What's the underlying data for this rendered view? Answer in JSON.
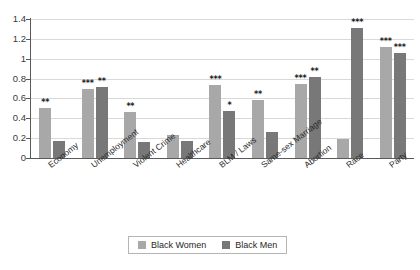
{
  "chart_data": {
    "type": "bar",
    "title": "",
    "subtitle": "",
    "xlabel": "",
    "ylabel": "",
    "ylim": [
      0,
      1.4
    ],
    "yticks": [
      0,
      0.2,
      0.4,
      0.6,
      0.8,
      1,
      1.2,
      1.4
    ],
    "ytick_labels": [
      "0",
      "0.2",
      "0.4",
      "0.6",
      "0.8",
      "1",
      "1.2",
      "1.4"
    ],
    "grid": true,
    "legend_position": "bottom-center",
    "categories": [
      "Economy",
      "Unemployment",
      "Violent Crime",
      "Healthcare",
      "BLM / Laws",
      "Same-sex Marriage",
      "Abortion",
      "Race",
      "Party"
    ],
    "series": [
      {
        "name": "Black Women",
        "color": "#a8a8a8",
        "values": [
          0.5,
          0.7,
          0.46,
          0.23,
          0.74,
          0.58,
          0.75,
          0.19,
          1.12
        ],
        "annotations": [
          "**",
          "***",
          "**",
          "",
          "***",
          "**",
          "***",
          "",
          "***"
        ]
      },
      {
        "name": "Black Men",
        "color": "#787878",
        "values": [
          0.17,
          0.715,
          0.16,
          0.17,
          0.47,
          0.26,
          0.82,
          1.31,
          1.06
        ],
        "annotations": [
          "",
          "**",
          "",
          "",
          "*",
          "",
          "**",
          "***",
          "***"
        ]
      }
    ]
  },
  "legend": {
    "items": [
      {
        "label": "Black Women",
        "color": "#a8a8a8",
        "swatch": "legend-swatch-women"
      },
      {
        "label": "Black Men",
        "color": "#787878",
        "swatch": "legend-swatch-men"
      }
    ]
  },
  "axis": {
    "y_tick_labels": [
      "1.4",
      "1.2",
      "1",
      "0.8",
      "0.6",
      "0.4",
      "0.2",
      "0"
    ],
    "x_tick_labels": [
      "Economy",
      "Unemployment",
      "Violent Crime",
      "Healthcare",
      "BLM / Laws",
      "Same-sex Marriage",
      "Abortion",
      "Race",
      "Party"
    ]
  }
}
